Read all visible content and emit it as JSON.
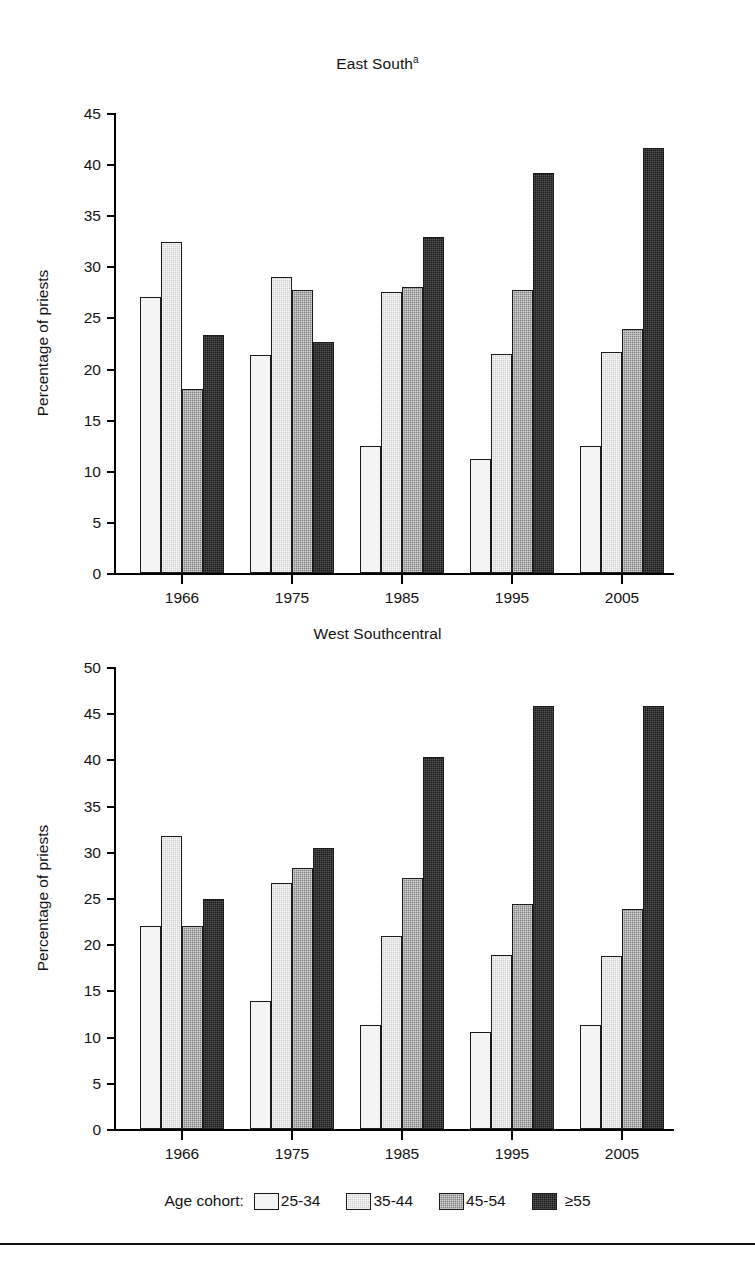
{
  "figure": {
    "legend": {
      "title": "Age cohort:",
      "items": [
        {
          "label": "25-34",
          "swatch": "white-open",
          "color": "#f4f4f4"
        },
        {
          "label": "35-44",
          "swatch": "light-gray-dither",
          "color": "#cfcfcf"
        },
        {
          "label": "45-54",
          "swatch": "dark-gray-dither",
          "color": "#7f7f7f"
        },
        {
          "label": "≥55",
          "swatch": "black-fill",
          "color": "#191919"
        }
      ]
    }
  },
  "chart_data": [
    {
      "type": "bar",
      "title": "East South",
      "title_superscript": "a",
      "xlabel": "",
      "ylabel": "Percentage of priests",
      "categories": [
        "1966",
        "1975",
        "1985",
        "1995",
        "2005"
      ],
      "ylim": [
        0,
        45
      ],
      "yticks": [
        0,
        5,
        10,
        15,
        20,
        25,
        30,
        35,
        40,
        45
      ],
      "grid": false,
      "legend_position": "figure-bottom",
      "series": [
        {
          "name": "25-34",
          "values": [
            27.0,
            21.3,
            12.4,
            11.2,
            12.4
          ]
        },
        {
          "name": "35-44",
          "values": [
            32.4,
            29.0,
            27.5,
            21.4,
            21.6
          ]
        },
        {
          "name": "45-54",
          "values": [
            18.0,
            27.7,
            28.0,
            27.7,
            23.9
          ]
        },
        {
          "name": "≥55",
          "values": [
            23.3,
            22.6,
            32.9,
            39.1,
            41.6
          ]
        }
      ]
    },
    {
      "type": "bar",
      "title": "West Southcentral",
      "title_superscript": "",
      "xlabel": "",
      "ylabel": "Percentage of priests",
      "categories": [
        "1966",
        "1975",
        "1985",
        "1995",
        "2005"
      ],
      "ylim": [
        0,
        50
      ],
      "yticks": [
        0,
        5,
        10,
        15,
        20,
        25,
        30,
        35,
        40,
        45,
        50
      ],
      "grid": false,
      "legend_position": "figure-bottom",
      "series": [
        {
          "name": "25-34",
          "values": [
            22.0,
            13.9,
            11.3,
            10.5,
            11.3
          ]
        },
        {
          "name": "35-44",
          "values": [
            31.7,
            26.6,
            20.9,
            18.8,
            18.7
          ]
        },
        {
          "name": "45-54",
          "values": [
            22.0,
            28.2,
            27.2,
            24.3,
            23.8
          ]
        },
        {
          "name": "≥55",
          "values": [
            24.9,
            30.4,
            40.3,
            45.8,
            45.8
          ]
        }
      ]
    }
  ]
}
